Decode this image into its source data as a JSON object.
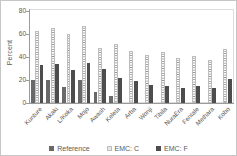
{
  "chart_data": {
    "type": "bar",
    "title": "",
    "xlabel": "",
    "ylabel": "Percent",
    "ylim": [
      0,
      80
    ],
    "yticks": [
      0,
      20,
      40,
      60,
      80
    ],
    "grid": false,
    "legend_position": "bottom",
    "categories": [
      "Kunture",
      "Akaki",
      "L/Koka",
      "Mojo",
      "Awash",
      "Keleta",
      "Arba",
      "Wonji",
      "Tibila",
      "NuraEra",
      "Fentale",
      "Methara",
      "Kobo"
    ],
    "series": [
      {
        "name": "Reference",
        "pattern": "solid",
        "color": "#696969",
        "values": [
          20,
          20,
          14,
          20,
          10,
          6,
          null,
          null,
          null,
          null,
          null,
          null,
          null
        ]
      },
      {
        "name": "EMC: C",
        "pattern": "dots",
        "color": "#ffffff",
        "values": [
          63,
          65,
          60,
          67,
          48,
          51,
          45,
          42,
          44,
          39,
          41,
          37,
          47
        ]
      },
      {
        "name": "EMC: F",
        "pattern": "solid",
        "color": "#4d4d4d",
        "values": [
          33,
          34,
          29,
          35,
          30,
          22,
          19,
          16,
          15,
          13,
          15,
          13,
          21
        ]
      }
    ],
    "colors": {
      "axis": "#9b9b9b",
      "text": "#595959",
      "plot_border": "#dcdcdc",
      "chart_border": "#c6c6c6",
      "dot_fill": "#8f8f8f"
    }
  }
}
